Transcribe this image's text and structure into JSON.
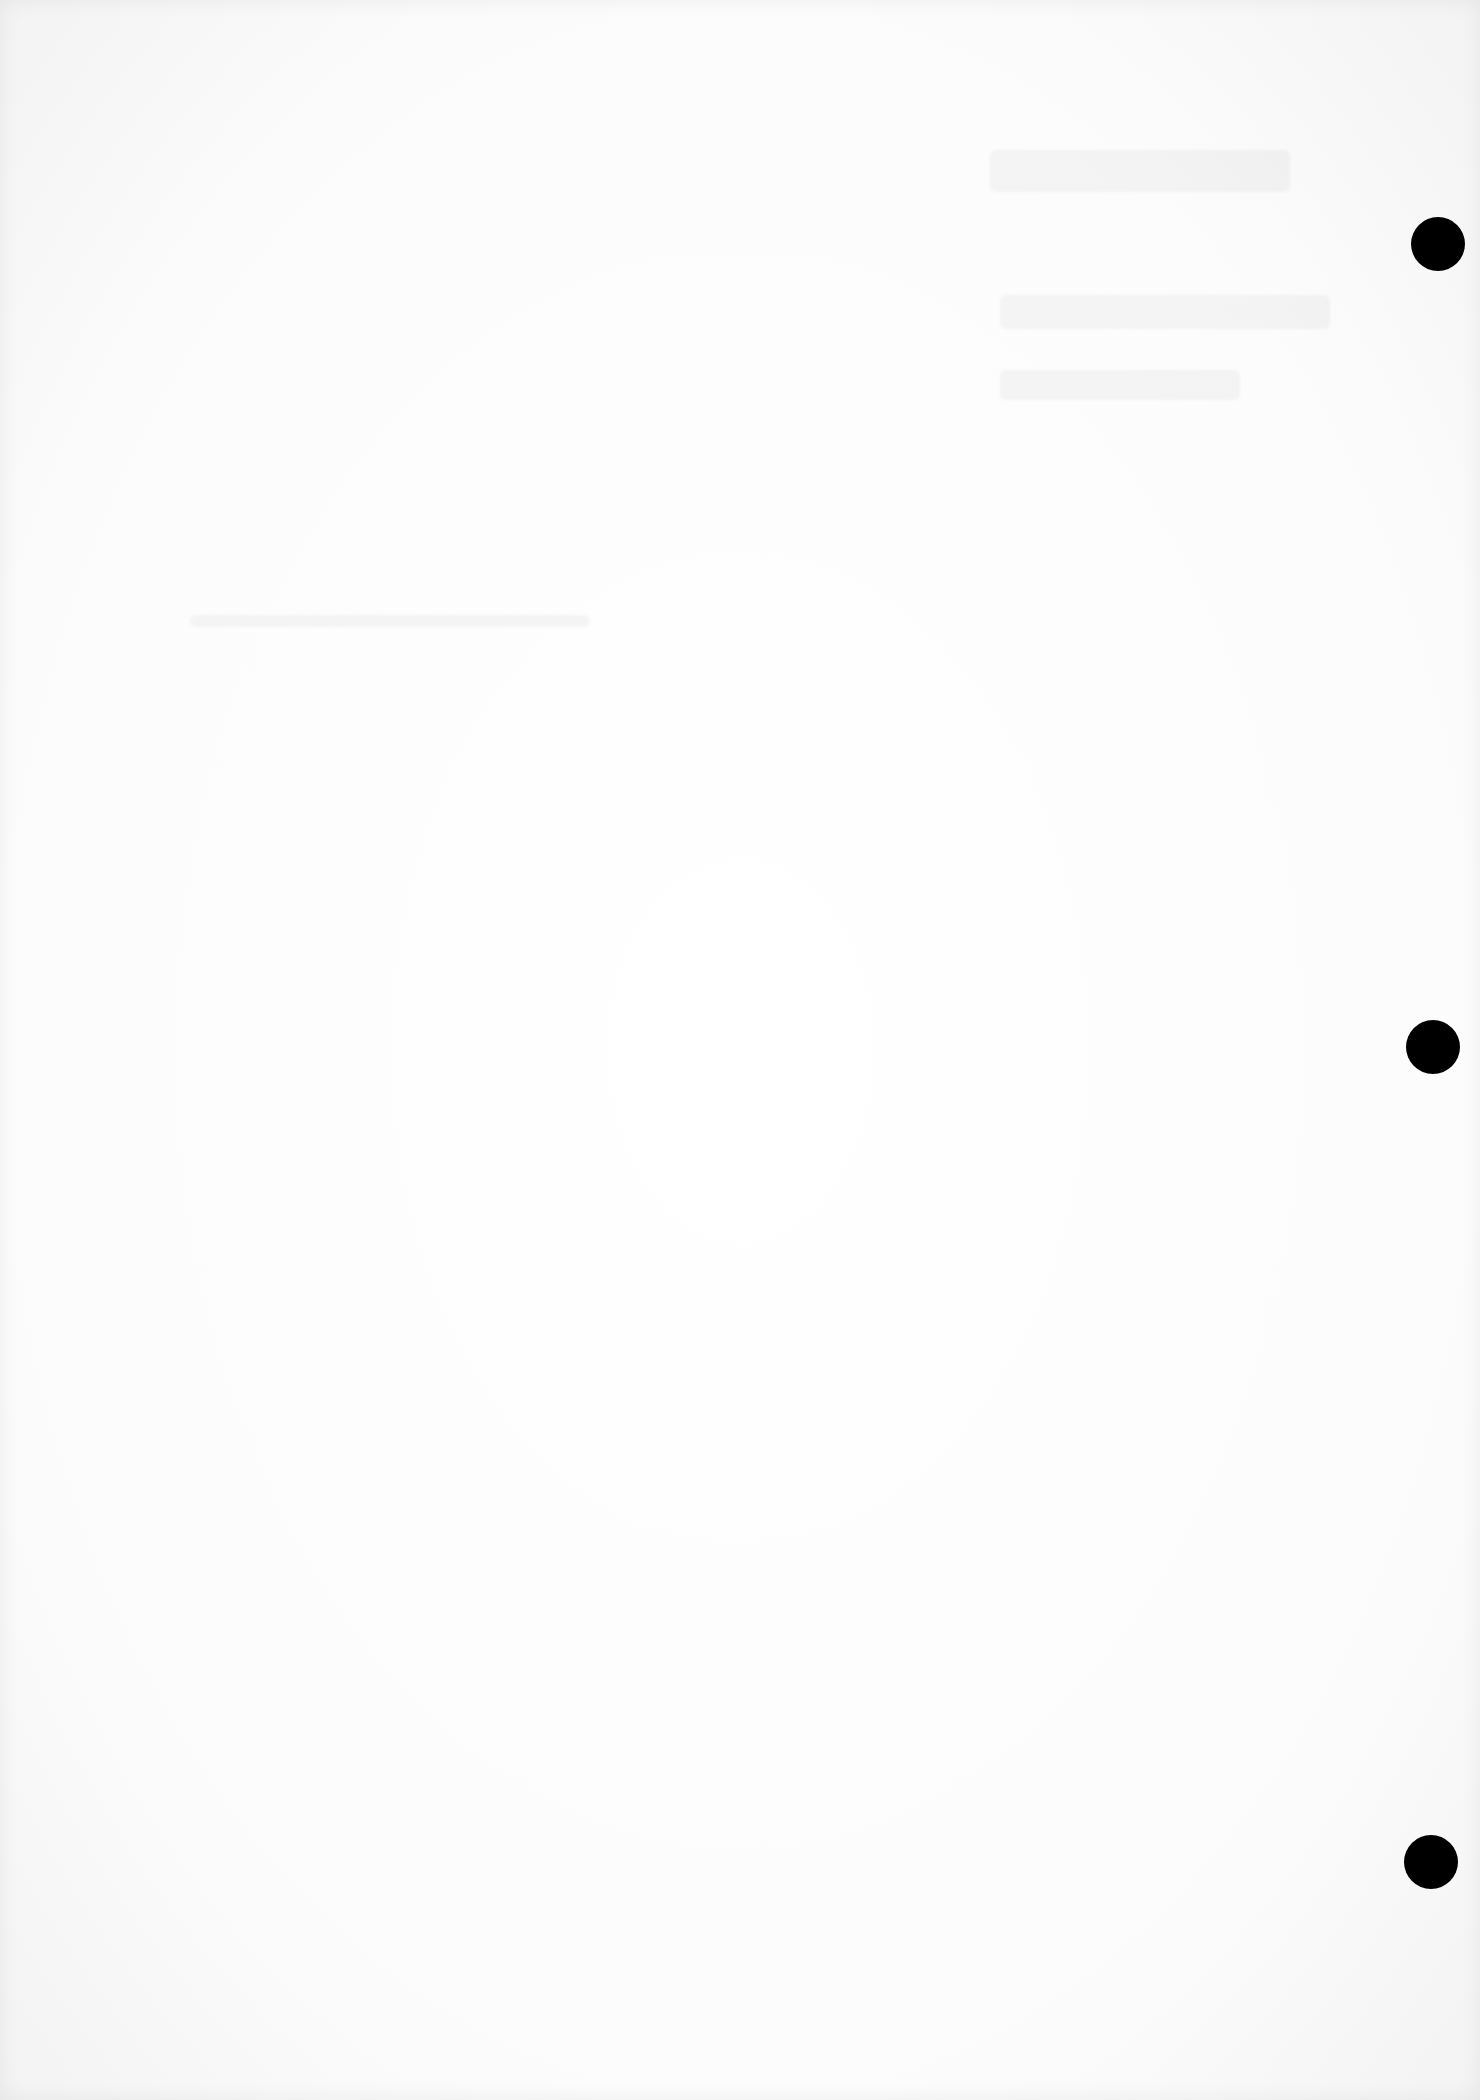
{
  "page": {
    "background_color": "#fdfdfd"
  },
  "punch_holes": [
    {
      "cx": 1438,
      "cy": 244,
      "r": 27,
      "color": "#000000"
    },
    {
      "cx": 1433,
      "cy": 1047,
      "r": 27,
      "color": "#000000"
    },
    {
      "cx": 1431,
      "cy": 1862,
      "r": 27,
      "color": "#000000"
    }
  ],
  "ghost_marks": [
    {
      "x": 990,
      "y": 150,
      "w": 300,
      "h": 42
    },
    {
      "x": 1000,
      "y": 295,
      "w": 330,
      "h": 34
    },
    {
      "x": 1000,
      "y": 370,
      "w": 240,
      "h": 30
    },
    {
      "x": 190,
      "y": 615,
      "w": 400,
      "h": 12
    }
  ]
}
